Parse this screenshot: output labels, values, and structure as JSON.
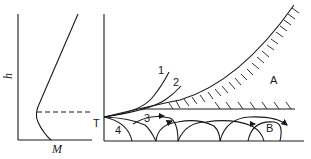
{
  "left_panel": {
    "y_axis_label": "h",
    "x_axis_label": "M",
    "description": "Modified refractivity M vs height h profile with a trapping layer"
  },
  "right_panel": {
    "level_label": "T",
    "region_labels": {
      "upper": "A",
      "lower": "B"
    },
    "ray_labels": [
      "1",
      "2",
      "3",
      "4"
    ]
  },
  "colors": {
    "line": "#1a1a1a",
    "background": "#ffffff"
  }
}
